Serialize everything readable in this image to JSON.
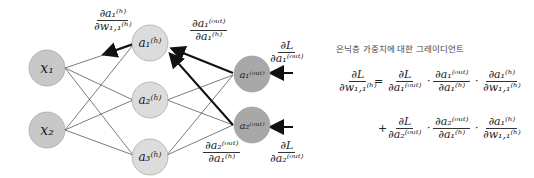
{
  "diagram": {
    "nodes": {
      "x1": "x₁",
      "x2": "x₂",
      "a1h": "a₁⁽ʰ⁾",
      "a2h": "a₂⁽ʰ⁾",
      "a3h": "a₃⁽ʰ⁾",
      "a1out": "a₁⁽ᵒᵘᵗ⁾",
      "a2out": "a₂⁽ᵒᵘᵗ⁾"
    },
    "colors": {
      "input": "#c8c8c8",
      "hidden": "#dcdcdc",
      "output": "#a8a8a8",
      "arrow": "#111111"
    },
    "labels": {
      "d_a1h_dw11": {
        "num": "∂a₁⁽ʰ⁾",
        "den": "∂w₁,₁⁽ʰ⁾"
      },
      "d_a1out_da1h": {
        "num": "∂a₁⁽ᵒᵘᵗ⁾",
        "den": "∂a₁⁽ʰ⁾"
      },
      "d_a2out_da1h": {
        "num": "∂a₂⁽ᵒᵘᵗ⁾",
        "den": "∂a₁⁽ʰ⁾"
      },
      "dL_da1out": {
        "num": "∂L",
        "den": "∂a₁⁽ᵒᵘᵗ⁾"
      },
      "dL_da2out": {
        "num": "∂L",
        "den": "∂a₂⁽ᵒᵘᵗ⁾"
      }
    }
  },
  "formula": {
    "title": "은닉층 가중치에 대한 그레이디언트",
    "lhs": {
      "num": "∂L",
      "den": "∂w₁,₁⁽ʰ⁾"
    },
    "eq": "=",
    "plus": "+",
    "dot": "·",
    "line1": [
      {
        "num": "∂L",
        "den": "∂a₁⁽ᵒᵘᵗ⁾"
      },
      {
        "num": "∂a₁⁽ᵒᵘᵗ⁾",
        "den": "∂a₁⁽ʰ⁾"
      },
      {
        "num": "∂a₁⁽ʰ⁾",
        "den": "∂w₁,₁⁽ʰ⁾"
      }
    ],
    "line2": [
      {
        "num": "∂L",
        "den": "∂a₂⁽ᵒᵘᵗ⁾"
      },
      {
        "num": "∂a₂⁽ᵒᵘᵗ⁾",
        "den": "∂a₁⁽ʰ⁾"
      },
      {
        "num": "∂a₁⁽ʰ⁾",
        "den": "∂w₁,₁⁽ʰ⁾"
      }
    ]
  }
}
